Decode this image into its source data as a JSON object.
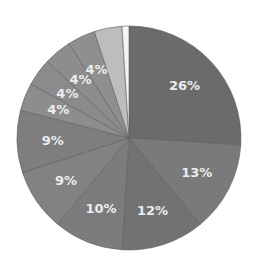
{
  "chart_data": {
    "type": "pie",
    "title": "",
    "start_angle": "12 o'clock",
    "direction": "clockwise",
    "legend": "none",
    "slices": [
      {
        "label": "26%",
        "value": 26,
        "color": "#6b6b6b",
        "show_label": true
      },
      {
        "label": "13%",
        "value": 13,
        "color": "#7a7a7a",
        "show_label": true
      },
      {
        "label": "12%",
        "value": 12,
        "color": "#727272",
        "show_label": true
      },
      {
        "label": "10%",
        "value": 10,
        "color": "#7c7c7c",
        "show_label": true
      },
      {
        "label": "9%",
        "value": 9,
        "color": "#828282",
        "show_label": true
      },
      {
        "label": "9%",
        "value": 9,
        "color": "#7e7e7e",
        "show_label": true
      },
      {
        "label": "4%",
        "value": 4,
        "color": "#8d8d8d",
        "show_label": true
      },
      {
        "label": "4%",
        "value": 4,
        "color": "#8b8b8b",
        "show_label": true
      },
      {
        "label": "4%",
        "value": 4,
        "color": "#8d8d8d",
        "show_label": true
      },
      {
        "label": "4%",
        "value": 4,
        "color": "#8f8f8f",
        "show_label": true
      },
      {
        "label": "",
        "value": 4,
        "color": "#bdbdbd",
        "show_label": false
      },
      {
        "label": "",
        "value": 1,
        "color": "#f4f4f4",
        "show_label": false
      }
    ]
  },
  "layout": {
    "cx": 129,
    "cy": 138,
    "r": 112,
    "label_radius_ratio": 0.68,
    "divider_color": "#5e5e5e"
  }
}
